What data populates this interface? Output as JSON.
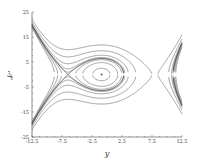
{
  "chart_data": {
    "type": "line",
    "title": "",
    "subtitle": "Phase portrait (level curves of energy)",
    "xlabel": "y",
    "ylabel": "y'",
    "xlim": [
      -12.5,
      12.5
    ],
    "ylim": [
      -25,
      25
    ],
    "x_ticks": [
      "-12.5",
      "-7.5",
      "-2.5",
      "2.5",
      "7.5",
      "12.5"
    ],
    "y_ticks": [
      "25",
      "15",
      "5",
      "-5",
      "-15",
      "-25"
    ],
    "x_tick_values": [
      -12.5,
      -7.5,
      -2.5,
      2.5,
      7.5,
      12.5
    ],
    "y_tick_values": [
      25,
      15,
      5,
      -5,
      -15,
      -25
    ],
    "grid": false,
    "legend": null,
    "equilibria": [
      {
        "type": "saddle",
        "y": -6.5,
        "yp": 0
      },
      {
        "type": "center",
        "y": -0.9,
        "yp": 0
      },
      {
        "type": "saddle",
        "y": 8.0,
        "yp": 0
      }
    ],
    "potential_roots": [
      -6.5,
      -0.9,
      8.0
    ],
    "potential_scale": 0.06,
    "energy_levels_inside": [
      0.15,
      0.55,
      0.85
    ],
    "energy_levels_outside": [
      1.02,
      1.12,
      1.45,
      2.2,
      3.4
    ],
    "curve_color": "#555555",
    "axis_color": "#444444"
  },
  "axes": {
    "x_label": "y",
    "y_label": "y'"
  }
}
